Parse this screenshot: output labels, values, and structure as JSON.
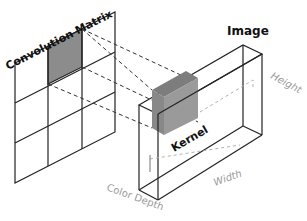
{
  "diagram": {
    "convolution_matrix": {
      "title": "Convolution Matrix",
      "rows": 3,
      "cols": 3,
      "highlighted_cell": [
        0,
        1
      ]
    },
    "image": {
      "title": "Image"
    },
    "kernel": {
      "label": "Kernel"
    },
    "axes": {
      "height": "Height",
      "width": "Width",
      "depth": "Color Depth"
    },
    "colors": {
      "line": "#222222",
      "highlight": "#8c8c8c",
      "kernel_face": "#9a9a9a",
      "kernel_top": "#7d7d7d",
      "axis_label": "#9a9a9a",
      "dashed_gray": "#b0b0b0"
    }
  }
}
